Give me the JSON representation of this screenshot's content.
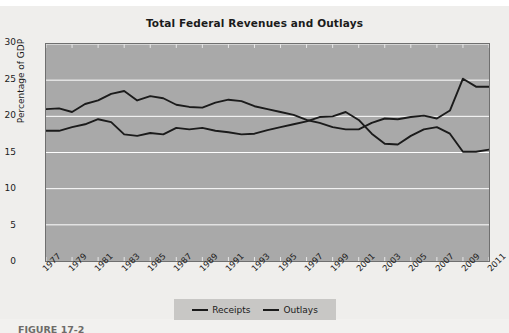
{
  "figure": {
    "caption": "FIGURE 17-2"
  },
  "chart_data": {
    "type": "line",
    "title": "Total Federal Revenues and Outlays",
    "xlabel": "",
    "ylabel": "Percentage of GDP",
    "ylim": [
      0,
      30
    ],
    "xlim": [
      1977,
      2011
    ],
    "yticks": [
      0,
      5,
      10,
      15,
      20,
      25,
      30
    ],
    "grid": true,
    "grid_color": "#ffffff",
    "plot_background": "#a9a9a9",
    "line_color": "#1b1b1b",
    "legend_position": "bottom-center",
    "xtick_labels": [
      "1977",
      "1979",
      "1981",
      "1983",
      "1985",
      "1987",
      "1989",
      "1991",
      "1993",
      "1995",
      "1997",
      "1999",
      "2001",
      "2003",
      "2005",
      "2007",
      "2009",
      "2011"
    ],
    "x": [
      1977,
      1978,
      1979,
      1980,
      1981,
      1982,
      1983,
      1984,
      1985,
      1986,
      1987,
      1988,
      1989,
      1990,
      1991,
      1992,
      1993,
      1994,
      1995,
      1996,
      1997,
      1998,
      1999,
      2000,
      2001,
      2002,
      2003,
      2004,
      2005,
      2006,
      2007,
      2008,
      2009,
      2010,
      2011
    ],
    "series": [
      {
        "name": "Receipts",
        "values": [
          18.0,
          18.0,
          18.5,
          18.9,
          19.6,
          19.2,
          17.5,
          17.3,
          17.7,
          17.5,
          18.4,
          18.2,
          18.4,
          18.0,
          17.8,
          17.5,
          17.6,
          18.1,
          18.5,
          18.9,
          19.3,
          19.9,
          20.0,
          20.6,
          19.5,
          17.6,
          16.2,
          16.1,
          17.3,
          18.2,
          18.5,
          17.6,
          15.1,
          15.1,
          15.4
        ]
      },
      {
        "name": "Outlays",
        "values": [
          21.0,
          21.1,
          20.6,
          21.7,
          22.2,
          23.1,
          23.5,
          22.2,
          22.8,
          22.5,
          21.6,
          21.3,
          21.2,
          21.9,
          22.3,
          22.1,
          21.4,
          21.0,
          20.6,
          20.2,
          19.5,
          19.1,
          18.5,
          18.2,
          18.2,
          19.1,
          19.7,
          19.6,
          19.9,
          20.1,
          19.7,
          20.8,
          25.2,
          24.1,
          24.1
        ]
      }
    ]
  },
  "legend": {
    "items": [
      {
        "label": "Receipts"
      },
      {
        "label": "Outlays"
      }
    ]
  }
}
